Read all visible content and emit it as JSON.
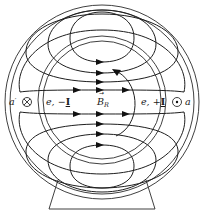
{
  "figure": {
    "stroke_color": "#2a2a2a",
    "background": "#ffffff"
  },
  "labels": {
    "a_prime": "a",
    "a_prime_mark": "′",
    "conductor_in_symbol": "⊗",
    "left_emf_e": "e, −",
    "left_current": "I",
    "field_vector": "B",
    "field_vector_subscript": "R",
    "field_vector_arrow": "→",
    "right_emf_e": "e, +",
    "right_current": "I",
    "conductor_out_symbol": "⊙",
    "a": "a"
  },
  "components": [
    {
      "name": "stator-outer-ring",
      "type": "circle"
    },
    {
      "name": "stator-inner-ring",
      "type": "circle"
    },
    {
      "name": "rotor",
      "type": "circle"
    },
    {
      "name": "field-lines",
      "count": 8,
      "direction": "left-to-right"
    },
    {
      "name": "rotation-arrow",
      "direction": "counterclockwise"
    },
    {
      "name": "base",
      "type": "trapezoid"
    }
  ]
}
